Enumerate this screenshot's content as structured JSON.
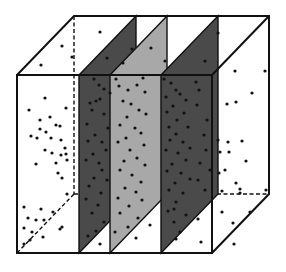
{
  "figure": {
    "width": 286,
    "height": 272,
    "background": "#ffffff",
    "colors": {
      "edge": "#111111",
      "plane_dark": "#4a4a4a",
      "plane_light": "#a8a8a8",
      "point": "#111111"
    },
    "cube": {
      "front": {
        "x0": 17,
        "x1": 212,
        "y0": 75,
        "y1": 253
      },
      "depth_offset": {
        "dx": 57,
        "dy": -59
      }
    },
    "planes": [
      {
        "id": "plane-1",
        "shade": "dark",
        "front_x": 79
      },
      {
        "id": "plane-2",
        "shade": "light",
        "front_x": 110
      },
      {
        "id": "plane-3",
        "shade": "dark",
        "front_x": 161
      }
    ],
    "points": [
      [
        100,
        32
      ],
      [
        62,
        46
      ],
      [
        41,
        65
      ],
      [
        72,
        57
      ],
      [
        132,
        49
      ],
      [
        107,
        58
      ],
      [
        123,
        63
      ],
      [
        151,
        48
      ],
      [
        165,
        61
      ],
      [
        218,
        33
      ],
      [
        205,
        61
      ],
      [
        235,
        71
      ],
      [
        265,
        71
      ],
      [
        45,
        98
      ],
      [
        29,
        110
      ],
      [
        50,
        117
      ],
      [
        66,
        108
      ],
      [
        40,
        120
      ],
      [
        56,
        125
      ],
      [
        40,
        129
      ],
      [
        46,
        132
      ],
      [
        60,
        126
      ],
      [
        31,
        136
      ],
      [
        37,
        138
      ],
      [
        51,
        138
      ],
      [
        61,
        140
      ],
      [
        65,
        148
      ],
      [
        45,
        150
      ],
      [
        52,
        153
      ],
      [
        61,
        155
      ],
      [
        66,
        154
      ],
      [
        36,
        164
      ],
      [
        56,
        163
      ],
      [
        67,
        160
      ],
      [
        58,
        173
      ],
      [
        62,
        178
      ],
      [
        67,
        194
      ],
      [
        24,
        207
      ],
      [
        41,
        209
      ],
      [
        28,
        218
      ],
      [
        36,
        220
      ],
      [
        53,
        212
      ],
      [
        44,
        220
      ],
      [
        62,
        227
      ],
      [
        24,
        228
      ],
      [
        32,
        232
      ],
      [
        60,
        229
      ],
      [
        30,
        240
      ],
      [
        43,
        237
      ],
      [
        24,
        244
      ],
      [
        94,
        79
      ],
      [
        99,
        85
      ],
      [
        104,
        89
      ],
      [
        110,
        93
      ],
      [
        96,
        101
      ],
      [
        100,
        99
      ],
      [
        90,
        103
      ],
      [
        92,
        110
      ],
      [
        104,
        114
      ],
      [
        87,
        124
      ],
      [
        108,
        128
      ],
      [
        95,
        135
      ],
      [
        88,
        141
      ],
      [
        102,
        142
      ],
      [
        106,
        150
      ],
      [
        93,
        154
      ],
      [
        86,
        160
      ],
      [
        99,
        163
      ],
      [
        102,
        170
      ],
      [
        94,
        178
      ],
      [
        107,
        180
      ],
      [
        89,
        186
      ],
      [
        101,
        193
      ],
      [
        86,
        199
      ],
      [
        98,
        205
      ],
      [
        92,
        213
      ],
      [
        104,
        222
      ],
      [
        96,
        231
      ],
      [
        88,
        236
      ],
      [
        100,
        244
      ],
      [
        116,
        79
      ],
      [
        119,
        86
      ],
      [
        128,
        90
      ],
      [
        137,
        85
      ],
      [
        143,
        78
      ],
      [
        145,
        92
      ],
      [
        123,
        101
      ],
      [
        131,
        104
      ],
      [
        139,
        110
      ],
      [
        127,
        117
      ],
      [
        146,
        114
      ],
      [
        120,
        125
      ],
      [
        135,
        128
      ],
      [
        141,
        133
      ],
      [
        126,
        138
      ],
      [
        118,
        142
      ],
      [
        144,
        145
      ],
      [
        130,
        150
      ],
      [
        137,
        158
      ],
      [
        124,
        161
      ],
      [
        145,
        165
      ],
      [
        120,
        170
      ],
      [
        132,
        175
      ],
      [
        141,
        182
      ],
      [
        125,
        188
      ],
      [
        136,
        192
      ],
      [
        118,
        198
      ],
      [
        142,
        200
      ],
      [
        129,
        206
      ],
      [
        120,
        213
      ],
      [
        138,
        218
      ],
      [
        128,
        227
      ],
      [
        115,
        232
      ],
      [
        136,
        238
      ],
      [
        164,
        79
      ],
      [
        171,
        83
      ],
      [
        176,
        90
      ],
      [
        166,
        97
      ],
      [
        180,
        94
      ],
      [
        186,
        100
      ],
      [
        173,
        106
      ],
      [
        167,
        112
      ],
      [
        184,
        113
      ],
      [
        177,
        120
      ],
      [
        169,
        127
      ],
      [
        188,
        127
      ],
      [
        176,
        134
      ],
      [
        170,
        140
      ],
      [
        183,
        142
      ],
      [
        190,
        148
      ],
      [
        166,
        150
      ],
      [
        178,
        153
      ],
      [
        186,
        160
      ],
      [
        172,
        164
      ],
      [
        167,
        171
      ],
      [
        181,
        173
      ],
      [
        190,
        179
      ],
      [
        175,
        183
      ],
      [
        169,
        190
      ],
      [
        183,
        193
      ],
      [
        176,
        202
      ],
      [
        168,
        211
      ],
      [
        186,
        215
      ],
      [
        174,
        222
      ],
      [
        180,
        232
      ],
      [
        196,
        82
      ],
      [
        199,
        90
      ],
      [
        197,
        105
      ],
      [
        207,
        120
      ],
      [
        204,
        135
      ],
      [
        206,
        150
      ],
      [
        200,
        163
      ],
      [
        210,
        170
      ],
      [
        198,
        180
      ],
      [
        205,
        190
      ],
      [
        227,
        104
      ],
      [
        236,
        102
      ],
      [
        252,
        93
      ],
      [
        218,
        140
      ],
      [
        228,
        142
      ],
      [
        242,
        141
      ],
      [
        220,
        152
      ],
      [
        229,
        152
      ],
      [
        246,
        161
      ],
      [
        225,
        170
      ],
      [
        219,
        173
      ],
      [
        236,
        183
      ],
      [
        240,
        189
      ],
      [
        240,
        193
      ],
      [
        222,
        191
      ],
      [
        266,
        190
      ],
      [
        222,
        212
      ],
      [
        250,
        212
      ],
      [
        233,
        223
      ],
      [
        174,
        209
      ],
      [
        198,
        219
      ],
      [
        176,
        239
      ],
      [
        201,
        242
      ],
      [
        234,
        244
      ],
      [
        150,
        225
      ]
    ]
  }
}
